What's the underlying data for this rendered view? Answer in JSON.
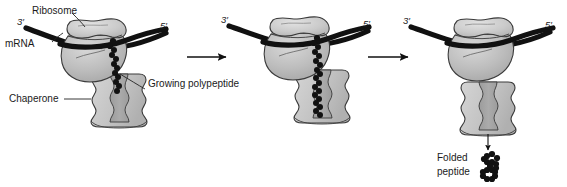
{
  "figure": {
    "background_color": "#ffffff",
    "ink_color": "#1a1a1a",
    "palette": {
      "ribosome_small_subunit": "#c9c9c9",
      "ribosome_large_subunit": "#b8b8b8",
      "ribosome_outline": "#3a3a3a",
      "chaperone_lobe": "#c6c6c6",
      "chaperone_channel": "#a4a4a4",
      "chaperone_outline": "#3a3a3a",
      "mrna_strand": "#111111",
      "polypeptide_bead": "#111111",
      "arrow": "#111111",
      "leader_line": "#222222"
    }
  },
  "labels": {
    "ribosome": "Ribosome",
    "mrna": "mRNA",
    "chaperone": "Chaperone",
    "growing_polypeptide": "Growing polypeptide",
    "folded_line1": "Folded",
    "folded_line2": "peptide",
    "three_prime": "3′",
    "five_prime": "5′"
  },
  "panels": [
    {
      "id": "panel-1",
      "stage": "initiation",
      "three_prime": "3′",
      "five_prime": "5′",
      "has_ribosome": true,
      "has_chaperone": true,
      "has_polypeptide": true,
      "polypeptide_length": "short",
      "callouts": [
        "Ribosome",
        "mRNA",
        "Chaperone",
        "Growing polypeptide"
      ]
    },
    {
      "id": "panel-2",
      "stage": "elongation",
      "three_prime": "3′",
      "five_prime": "5′",
      "has_ribosome": true,
      "has_chaperone": true,
      "has_polypeptide": true,
      "polypeptide_length": "long",
      "callouts": []
    },
    {
      "id": "panel-3",
      "stage": "release-and-folding",
      "three_prime": "3′",
      "five_prime": "5′",
      "has_ribosome": true,
      "has_chaperone": true,
      "has_polypeptide": false,
      "polypeptide_length": "none",
      "callouts": [
        "Folded peptide"
      ]
    }
  ],
  "arrows": [
    {
      "id": "arrow-1",
      "from": "panel-1",
      "to": "panel-2",
      "direction": "right"
    },
    {
      "id": "arrow-2",
      "from": "panel-2",
      "to": "panel-3",
      "direction": "right"
    },
    {
      "id": "arrow-release",
      "from": "chaperone",
      "to": "folded-peptide",
      "direction": "down"
    }
  ]
}
